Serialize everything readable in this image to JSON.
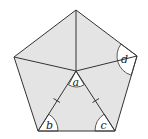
{
  "diagram": {
    "type": "regular-pentagon-with-center-lines",
    "fill_color": "#e4e4e4",
    "stroke_color": "#333333",
    "sector_fill": "#ffffff",
    "vertices": {
      "top": [
        76,
        10
      ],
      "right": [
        137,
        56
      ],
      "bottom_right": [
        115,
        131
      ],
      "bottom_left": [
        38,
        131
      ],
      "left": [
        14,
        57
      ]
    },
    "center": [
      76,
      71
    ],
    "labels": {
      "a": "a",
      "b": "b",
      "c": "c",
      "d": "d"
    },
    "tick_marks": {
      "description": "single tick marks indicating equal segments from center to bottom-left and bottom-right vertices",
      "count_per_segment": 1
    }
  }
}
